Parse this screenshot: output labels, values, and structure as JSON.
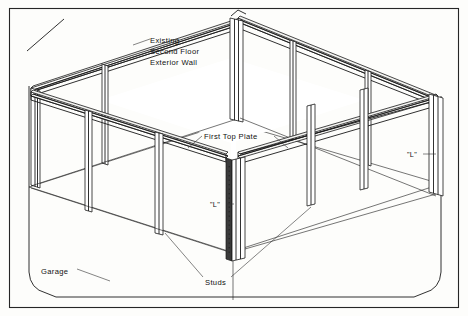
{
  "drawing": {
    "kind": "isometric-framing-diagram",
    "subject": "Garage wall framing with first top plate, studs and L corners",
    "line_color": "#1a1a1a",
    "background_color": "#fdfdfb",
    "border_color": "#262626"
  },
  "labels": {
    "existing_wall": {
      "line1": "Existing",
      "line2": "Second Floor",
      "line3": "Exterior Wall",
      "x": 148,
      "y": 40
    },
    "first_top_plate": {
      "text": "First Top Plate",
      "x": 204,
      "y": 137
    },
    "studs": {
      "text": "Studs",
      "x": 205,
      "y": 283
    },
    "garage": {
      "text": "Garage",
      "x": 41,
      "y": 272
    },
    "corner_l_center": {
      "text": "\"L\"",
      "x": 214,
      "y": 206
    },
    "corner_l_right": {
      "text": "\"L\"",
      "x": 411,
      "y": 156
    }
  },
  "geometry": {
    "frame_rect": {
      "x": 9,
      "y": 8,
      "w": 450,
      "h": 300
    },
    "corner_slash": {
      "x1": 27,
      "y1": 51,
      "x2": 64,
      "y2": 19
    },
    "plate_count": 2,
    "wall_segments": [
      "back-left",
      "back-right",
      "front-left",
      "front-right"
    ],
    "corner_posts": 3,
    "intermediate_studs": 7
  },
  "colors": {
    "plate_face": "#f4f4f2",
    "stud_face": "#ffffff",
    "shade_face": "#d8d8d6",
    "post_dark": "#3a3a3a"
  }
}
